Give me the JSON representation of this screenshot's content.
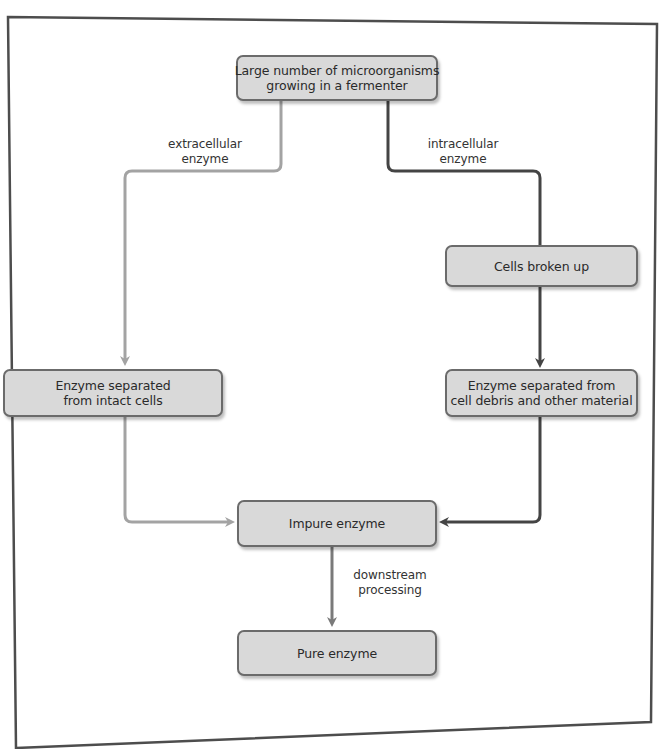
{
  "diagram": {
    "type": "flowchart",
    "colors": {
      "box_fill": "#d9d9d9",
      "box_border": "#6b6b6b",
      "extracellular_path": "#a3a3a3",
      "intracellular_path": "#444444",
      "downstream_path": "#7a7a7a",
      "frame": "#4d4d4d"
    },
    "nodes": {
      "start": {
        "line1": "Large number of microorganisms",
        "line2": "growing in a fermenter"
      },
      "cells_broken": {
        "line1": "Cells broken up"
      },
      "separated_intact": {
        "line1": "Enzyme separated",
        "line2": "from intact cells"
      },
      "separated_debris": {
        "line1": "Enzyme separated from",
        "line2": "cell debris and other material"
      },
      "impure": {
        "line1": "Impure enzyme"
      },
      "pure": {
        "line1": "Pure enzyme"
      }
    },
    "edge_labels": {
      "extracellular": {
        "line1": "extracellular",
        "line2": "enzyme"
      },
      "intracellular": {
        "line1": "intracellular",
        "line2": "enzyme"
      },
      "downstream": {
        "line1": "downstream",
        "line2": "processing"
      }
    },
    "edges": [
      {
        "from": "start",
        "to": "separated_intact",
        "label": "extracellular enzyme"
      },
      {
        "from": "start",
        "to": "cells_broken",
        "label": "intracellular enzyme"
      },
      {
        "from": "cells_broken",
        "to": "separated_debris",
        "label": ""
      },
      {
        "from": "separated_intact",
        "to": "impure",
        "label": ""
      },
      {
        "from": "separated_debris",
        "to": "impure",
        "label": ""
      },
      {
        "from": "impure",
        "to": "pure",
        "label": "downstream processing"
      }
    ]
  }
}
